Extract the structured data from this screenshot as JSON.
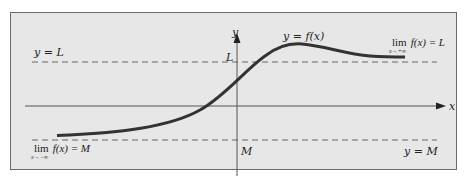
{
  "diagram": {
    "type": "function-graph-horizontal-asymptotes",
    "colors": {
      "panel_background": "#e7e7e7",
      "panel_border": "#6a6a6a",
      "curve": "#333333",
      "axes": "#444444",
      "asymptote_dash": "#666666",
      "text": "#222222"
    },
    "axes": {
      "x_label": "x",
      "y_label": "y"
    },
    "curve": {
      "label": "y = f(x)"
    },
    "asymptotes": {
      "upper": {
        "line_label": "y = L",
        "axis_tick_label": "L",
        "limit_word": "lim",
        "limit_sub": "x→+∞",
        "limit_expr": "f(x) = L"
      },
      "lower": {
        "line_label": "y = M",
        "axis_tick_label": "M",
        "limit_word": "lim",
        "limit_sub": "x→−∞",
        "limit_expr": "f(x) = M"
      }
    }
  }
}
